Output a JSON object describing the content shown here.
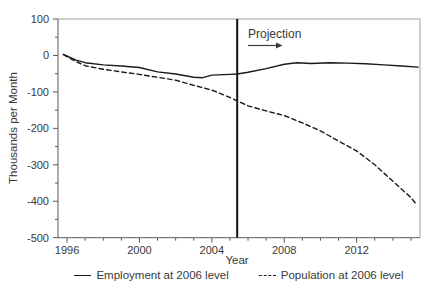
{
  "chart_data": {
    "type": "line",
    "title": "",
    "xlabel": "Year",
    "ylabel": "Thousands per Month",
    "x_range": [
      1995.5,
      2015.5
    ],
    "ylim": [
      -500,
      100
    ],
    "x_ticks_labeled": [
      1996,
      2000,
      2004,
      2008,
      2012
    ],
    "x_minor_tick_years": [
      1997,
      1998,
      1999,
      2001,
      2002,
      2003,
      2005,
      2006,
      2007,
      2009,
      2010,
      2011,
      2013,
      2014,
      2015
    ],
    "y_ticks_labeled": [
      100,
      0,
      -100,
      -200,
      -300,
      -400,
      -500
    ],
    "y_minor_ticks": [
      50,
      -50,
      -150,
      -250,
      -350,
      -450
    ],
    "grid": "off",
    "legend_position": "bottom-center",
    "annotation": {
      "text": "Projection",
      "line_x": 2005.4,
      "arrow_direction": "right"
    },
    "series": [
      {
        "name": "Employment at 2006 level",
        "style": "solid",
        "points": [
          [
            1995.8,
            3
          ],
          [
            1996.5,
            -13
          ],
          [
            1997,
            -20
          ],
          [
            1998,
            -26
          ],
          [
            1999,
            -29
          ],
          [
            2000,
            -33
          ],
          [
            2001,
            -45
          ],
          [
            2002,
            -51
          ],
          [
            2003,
            -60
          ],
          [
            2003.5,
            -61
          ],
          [
            2004,
            -54
          ],
          [
            2005,
            -52
          ],
          [
            2005.4,
            -51
          ],
          [
            2006,
            -46
          ],
          [
            2007,
            -36
          ],
          [
            2008,
            -24
          ],
          [
            2008.7,
            -20
          ],
          [
            2009.5,
            -22
          ],
          [
            2010.5,
            -20
          ],
          [
            2011.5,
            -21
          ],
          [
            2012.5,
            -23
          ],
          [
            2013.5,
            -26
          ],
          [
            2014.5,
            -29
          ],
          [
            2015.4,
            -32
          ]
        ]
      },
      {
        "name": "Population at 2006 level",
        "style": "dashed",
        "points": [
          [
            1995.8,
            2
          ],
          [
            1996.5,
            -17
          ],
          [
            1997,
            -28
          ],
          [
            1998,
            -38
          ],
          [
            1999,
            -45
          ],
          [
            2000,
            -52
          ],
          [
            2001,
            -60
          ],
          [
            2002,
            -68
          ],
          [
            2003,
            -82
          ],
          [
            2004,
            -95
          ],
          [
            2005,
            -115
          ],
          [
            2005.4,
            -125
          ],
          [
            2006,
            -138
          ],
          [
            2007,
            -152
          ],
          [
            2008,
            -165
          ],
          [
            2009,
            -185
          ],
          [
            2010,
            -207
          ],
          [
            2011,
            -235
          ],
          [
            2012,
            -262
          ],
          [
            2013,
            -300
          ],
          [
            2014,
            -345
          ],
          [
            2015,
            -390
          ],
          [
            2015.3,
            -408
          ]
        ]
      }
    ],
    "colors": {
      "line": "#1a1a1a",
      "axis": "#595959",
      "plot_border": "#9e9e9e",
      "text": "#383838",
      "projection_line": "#111111",
      "background": "#ffffff"
    }
  }
}
